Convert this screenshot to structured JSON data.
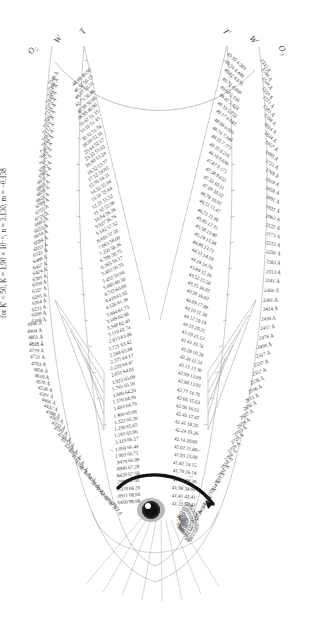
{
  "figure": {
    "type": "nomogram",
    "caption": "for K' < 50, K = 1.90 × 10⁻⁶, n = 3.130, m = −0.138",
    "pivot_icon": "eye-pivot-icon",
    "index_arrow_icon": "curved-index-arrow-icon"
  },
  "axes": {
    "left": [
      {
        "name": "axis-label-o2",
        "text": "O₂"
      },
      {
        "name": "axis-label-w",
        "text": "W"
      },
      {
        "name": "axis-label-t",
        "text": "T"
      }
    ],
    "right": [
      {
        "name": "axis-label-t-prime",
        "text": "T'"
      },
      {
        "name": "axis-label-w-prime",
        "text": "W'"
      },
      {
        "name": "axis-label-o3",
        "text": "O₃"
      }
    ]
  },
  "scales": {
    "left_outer": {
      "name": "left-outer-scale",
      "unit_prefix": "",
      "ticks": [
        "7540 Å",
        "7500 Å",
        "7457 Å",
        "7410 Å",
        "7373 Å",
        "7335 Å",
        "7291 Å",
        "7257 Å",
        "7217 Å",
        "7181 Å",
        "7144 Å",
        "7101 Å",
        "7065 Å",
        "7017 Å",
        "6993 Å",
        "6965 Å",
        "6931 Å",
        "6893 Å",
        "6859 Å",
        "6821 Å",
        "6789 Å",
        "6757 Å",
        "6721 Å",
        "6685 Å",
        "6653 Å",
        "6618 Å",
        "6584 Å",
        "6553 Å",
        "6521 Å",
        "6488 Å",
        "6457 Å",
        "6424 Å",
        "6391 Å",
        "6359 Å",
        "6327 Å",
        "6295 Å",
        "6264 Å",
        "6231 Å",
        "6200 Å",
        "6168 Å"
      ]
    },
    "left_lower_outer": {
      "name": "left-lower-outer-scale",
      "ticks": [
        "4946 Å",
        "4904 Å",
        "4861 Å",
        "4818 Å",
        "4779 Å",
        "4751 Å",
        "4703 Å",
        "4656 Å",
        "4616 Å",
        "4576 Å",
        "4538 Å",
        "4501 Å",
        "4466 Å",
        "4432 Å",
        "4398 Å",
        "4365 Å",
        "4332 Å",
        "4299 Å",
        "4266 Å",
        "4233 Å",
        "4200 Å",
        "4167 Å",
        "4127 Å",
        "4100 Å",
        "4075 Å",
        "4053 Å",
        "4021 Å",
        "3990 Å",
        "3962 Å",
        "3931 Å",
        "3901 Å",
        "3871 Å"
      ]
    },
    "right_outer": {
      "name": "right-outer-scale",
      "ticks": [
        "1532 Å",
        "1540 Å",
        "1549 Å",
        "1559 Å",
        "1571 Å",
        "1581 Å",
        "1598 Å",
        "1614 Å",
        "1634 Å",
        "1657 Å",
        "1685 Å",
        "1721 Å",
        "1768 Å",
        "1818 Å",
        "1858 Å",
        "1891 Å",
        "1922 Å",
        "2062 Å",
        "2122 Å",
        "2173 Å",
        "2213 Å",
        "2250 Å",
        "2283 Å",
        "2313 Å",
        "2341 Å",
        "2366 Å",
        "2391 Å",
        "2414 Å",
        "2436 Å",
        "2457 Å",
        "2478 Å",
        "2498 Å",
        "2517 Å",
        "2537 Å",
        "2557 Å",
        "2576 Å",
        "2596 Å",
        "2615 Å",
        "2636 Å",
        "2657 Å",
        "2679 Å",
        "2703 Å",
        "2729 Å",
        "2759 Å",
        "2796 Å",
        "2834 Å",
        "2881 Å",
        "2895 Å",
        "2934 Å",
        "2977 Å",
        "3021 Å",
        "3065 Å",
        "3127 Å"
      ]
    },
    "left_inner": {
      "name": "left-inner-scale",
      "header": "value / angle",
      "ticks": [
        "48.68 49.90",
        "46.52 50.15",
        "44.57 50.31",
        "42.73 50.48",
        "40.98 50.68",
        "38.99 40.90",
        "35.67 51.15",
        "33.10 51.43",
        "30.32 51.56",
        "28.00 52.16",
        "25.64 52.57",
        "23.22 53.02",
        "20.80 53.24",
        "18.52 53.77",
        "17.12 54.02",
        "15.70 54.31",
        "14.33 55.04",
        "13.31 55.04",
        "12.21 55.52",
        "11.32 55.98",
        "10.64 56.36",
        "9.927 56.76",
        "9.142 57.12",
        "8.410 57.56",
        "7.663 58.00",
        "7.250 58.36",
        "6.788 58.75",
        "6.265 59.17",
        "5.803 59.55",
        "5.452 59.94",
        "5.089 60.30",
        "4.735 60.68",
        "4.419 61.02",
        "4.126 61.38",
        "3.844 61.73",
        "3.589 62.06",
        "3.348 62.40",
        "3.118 62.74",
        "2.913 63.08",
        "2.721 63.42",
        "2.544 63.84",
        "2.375 64.17",
        "2.220 64.47",
        "2.031 64.81",
        "1.923 65.08",
        "1.795 65.39",
        "1.680 64.20",
        "1.578 64.50",
        "1.483 64.79",
        "1.400 65.08",
        "1.322 65.36",
        "1.250 65.65",
        "1.183 65.96",
        "1.119 66.17",
        "1.059 66.44",
        "1.003 66.71",
        ".9479 66.99",
        ".8946 67.28",
        ".8420 67.59",
        ".7903 67.91",
        ".7370 68.26",
        ".6911 68.60",
        ".6450 68.98"
      ]
    },
    "right_inner": {
      "name": "right-inner-scale",
      "ticks": [
        "49.99 4.209",
        "49.91 4.440",
        "49.82 4.676",
        "49.71 4.898",
        "49.60 5.116",
        "49.41 5.424",
        "49.33 5.752",
        "49.17 6.043",
        "48.98 6.901",
        "48.76 7.346",
        "48.55 7.771",
        "48.33 8.216",
        "48.10 8.656",
        "47.87 9.171",
        "47.58 9.652",
        "47.33 10.11",
        "47.09 10.52",
        "46.78 10.95",
        "46.51 11.42",
        "46.21 11.86",
        "45.86 12.31",
        "45.58 12.80",
        "45.24 13.24",
        "44.89 13.71",
        "44.53 14.19",
        "44.19 14.70",
        "43.89 15.16",
        "43.52 15.58",
        "43.15 16.02",
        "43.20 16.62",
        "44.09 17.00",
        "44.10 11.38",
        "44.12 19.19",
        "44.15 20.21",
        "43.19 21.12",
        "43.43 19.76",
        "43.28 10.28",
        "43.24 11.51",
        "43.13 12.30",
        "42.99 13.09",
        "42.88 13.91",
        "42.77 14.76",
        "42.66 15.63",
        "42.56 16.52",
        "42.45 17.47",
        "42.41 18.35",
        "42.24 19.26",
        "42.14 20.60",
        "42.02 21.80",
        "41.93 23.00",
        "41.82 24.15",
        "41.70 26.14",
        "41.58 28.30",
        "41.98 34.93",
        "41.41 43.41",
        "41.23 52.41"
      ]
    },
    "bottom_inner": {
      "name": "bottom-inner-scale",
      "ticks": [
        ".6075 69.35",
        ".5611 69.70",
        ".5173 70.06",
        ".4762 70.41",
        ".4368 70.82",
        ".3984 71.24",
        ".3620 71.68",
        ".3283 72.11",
        ".2963 72.57",
        ".2661 73.05",
        ".2375 73.55",
        ".2106 74.08",
        ".1850 74.63",
        ".1612 75.21",
        ".1393 75.82",
        ".1192 76.48",
        ".1009 77.16",
        ".08433 77.89"
      ]
    }
  }
}
